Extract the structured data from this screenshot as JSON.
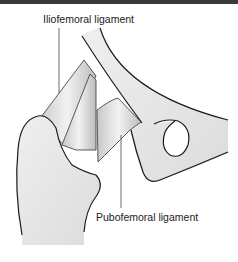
{
  "diagram": {
    "labels": {
      "iliofemoral": "Iliofemoral ligament",
      "pubofemoral": "Pubofemoral ligament"
    },
    "colors": {
      "bone_fill": "#e6e6e6",
      "ligament_fill": "#d4d4d4",
      "outline": "#1a1a1a",
      "leader_line": "#444444",
      "top_bar": "#3a3a3a"
    }
  }
}
